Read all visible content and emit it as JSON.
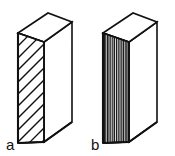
{
  "figure": {
    "background_color": "#ffffff",
    "line_color": "#111111",
    "width": 175,
    "height": 156,
    "panels": [
      {
        "id": "a",
        "label": "a",
        "label_x": 6,
        "label_y": 149,
        "pattern": "diagonal-hatching",
        "pattern_description": "parallel diagonal lines on front narrow face",
        "front_face": {
          "top_left_x": 18,
          "top_left_y": 33,
          "top_right_x": 44,
          "top_right_y": 42,
          "bottom_right_x": 44,
          "bottom_right_y": 142,
          "bottom_left_x": 18,
          "bottom_left_y": 143
        },
        "hatch_count": 13,
        "hatch_angle_deg": -45
      },
      {
        "id": "b",
        "label": "b",
        "label_x": 92,
        "label_y": 149,
        "pattern": "vertical-grain-lines",
        "pattern_description": "parallel vertical lines on front narrow face",
        "front_face": {
          "top_left_x": 103,
          "top_left_y": 33,
          "top_right_x": 129,
          "top_right_y": 42,
          "bottom_right_x": 129,
          "bottom_right_y": 142,
          "bottom_left_x": 103,
          "bottom_left_y": 143
        },
        "grain_count": 15,
        "grain_angle_deg": 90
      }
    ],
    "geometry_notes": {
      "projection": "oblique / isometric-like 3D block",
      "block_a_top_face": "18,33 48,13 72,22 44,42",
      "block_a_side_face": "44,42 72,22 72,122 44,142",
      "block_b_top_face": "103,33 133,13 157,22 129,42",
      "block_b_side_face": "129,42 157,22 157,122 129,142"
    }
  }
}
